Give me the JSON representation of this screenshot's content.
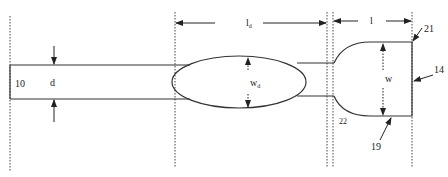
{
  "diagram": {
    "labels": {
      "ref_10": "10",
      "d": "d",
      "l_d_main": "l",
      "l_d_sub": "d",
      "w_d_main": "w",
      "w_d_sub": "d",
      "l": "l",
      "w": "w",
      "ref_21": "21",
      "ref_14": "14",
      "ref_22": "22",
      "ref_19": "19"
    },
    "colors": {
      "line": "#333333",
      "background": "#ffffff"
    }
  }
}
